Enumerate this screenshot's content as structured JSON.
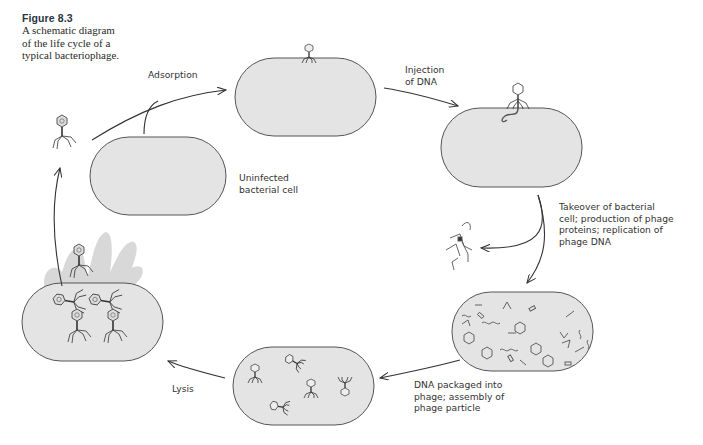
{
  "caption": {
    "figure_number": "Figure 8.3",
    "line1": "A schematic diagram",
    "line2": "of the life cycle of a",
    "line3": "typical bacteriophage."
  },
  "labels": {
    "adsorption": "Adsorption",
    "injection_line1": "Injection",
    "injection_line2": "of DNA",
    "uninfected_line1": "Uninfected",
    "uninfected_line2": "bacterial cell",
    "takeover_line1": "Takeover of bacterial",
    "takeover_line2": "cell; production of phage",
    "takeover_line3": "proteins; replication of",
    "takeover_line4": "phage DNA",
    "packaged_line1": "DNA packaged into",
    "packaged_line2": "phage; assembly of",
    "packaged_line3": "phage particle",
    "lysis": "Lysis"
  },
  "stages": [
    {
      "id": "uninfected",
      "name": "Uninfected bacterial cell"
    },
    {
      "id": "adsorption",
      "name": "Adsorption"
    },
    {
      "id": "injection",
      "name": "Injection of DNA"
    },
    {
      "id": "takeover",
      "name": "Takeover of bacterial cell; production of phage proteins; replication of phage DNA"
    },
    {
      "id": "assembly",
      "name": "DNA packaged into phage; assembly of phage particle"
    },
    {
      "id": "lysis",
      "name": "Lysis"
    }
  ],
  "colors": {
    "cell_fill": "#e4e4e4",
    "cell_stroke": "#555555",
    "lysis_cloud": "#d6d6d6",
    "text": "#333333"
  }
}
